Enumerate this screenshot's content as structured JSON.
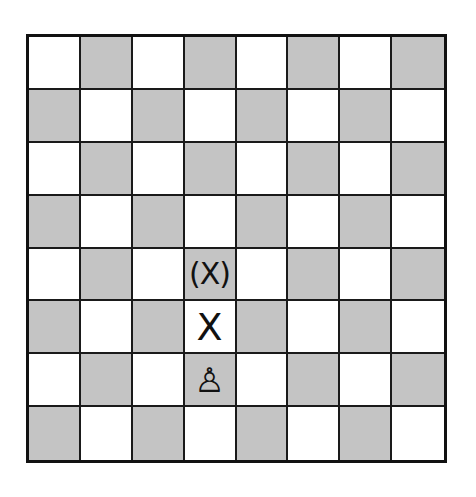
{
  "board": {
    "files": 8,
    "ranks": 8,
    "light_color": "#ffffff",
    "dark_color": "#c4c4c4",
    "line_color": "#111111",
    "top_left_square": "light"
  },
  "pieces": [
    {
      "type": "white-pawn",
      "glyph": "♙",
      "square": "d2",
      "row": 6,
      "col": 3
    }
  ],
  "marks": [
    {
      "label": "X",
      "square": "d3",
      "row": 5,
      "col": 3,
      "meaning": "single-step target"
    },
    {
      "label": "(X)",
      "square": "d4",
      "row": 4,
      "col": 3,
      "meaning": "optional double-step target"
    }
  ]
}
